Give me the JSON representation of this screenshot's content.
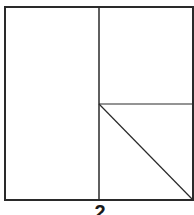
{
  "figure": {
    "label": "2",
    "stroke_color": "#2a2a2a",
    "background": "#ffffff",
    "shapes": {
      "outer_rectangle": {
        "x1": 5,
        "y1": 7,
        "x2": 193,
        "y2": 200
      },
      "vertical_divider": {
        "x": 99,
        "y1": 7,
        "y2": 200
      },
      "horizontal_divider": {
        "x1": 99,
        "x2": 193,
        "y": 104
      },
      "diagonal": {
        "x1": 99,
        "y1": 104,
        "x2": 193,
        "y2": 200
      }
    }
  }
}
